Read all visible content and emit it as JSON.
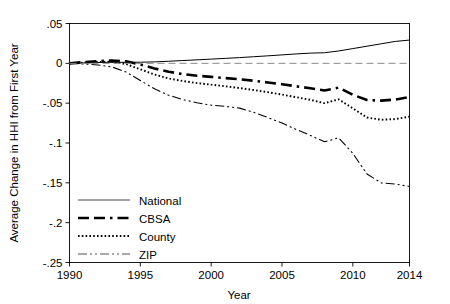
{
  "chart_data": {
    "type": "line",
    "title": "",
    "xlabel": "Year",
    "ylabel": "Average Change in HHI from First Year",
    "xlim": [
      1990,
      2014
    ],
    "ylim": [
      -0.25,
      0.05
    ],
    "xticks": [
      1990,
      1995,
      2000,
      2005,
      2010,
      2014
    ],
    "xtick_labels": [
      "1990",
      "1995",
      "2000",
      "2005",
      "2010",
      "2014"
    ],
    "yticks": [
      0.05,
      0,
      -0.05,
      -0.1,
      -0.15,
      -0.2,
      -0.25
    ],
    "ytick_labels": [
      ".05",
      "0",
      "-.05",
      "-.1",
      "-.15",
      "-.2",
      "-.25"
    ],
    "grid": false,
    "legend_position": "lower-left",
    "x": [
      1990,
      1991,
      1992,
      1993,
      1994,
      1995,
      1996,
      1997,
      1998,
      1999,
      2000,
      2001,
      2002,
      2003,
      2004,
      2005,
      2006,
      2007,
      2008,
      2009,
      2010,
      2011,
      2012,
      2013,
      2014
    ],
    "series": [
      {
        "name": "National",
        "style": "solid",
        "color": "#444444",
        "values": [
          0,
          0.0005,
          0.001,
          0.0013,
          0.0012,
          0.0014,
          0.0018,
          0.0026,
          0.0035,
          0.0044,
          0.0053,
          0.0062,
          0.0072,
          0.0083,
          0.0094,
          0.0106,
          0.0118,
          0.0128,
          0.0133,
          0.0155,
          0.0185,
          0.0215,
          0.0245,
          0.0275,
          0.0292
        ]
      },
      {
        "name": "CBSA",
        "style": "dashed",
        "color": "#000000",
        "values": [
          0,
          0.0015,
          0.0028,
          0.0035,
          0.0025,
          -0.0015,
          -0.0065,
          -0.0105,
          -0.0135,
          -0.0155,
          -0.017,
          -0.0185,
          -0.02,
          -0.0218,
          -0.024,
          -0.0262,
          -0.0288,
          -0.0312,
          -0.034,
          -0.0305,
          -0.0395,
          -0.046,
          -0.0468,
          -0.0455,
          -0.0423
        ]
      },
      {
        "name": "County",
        "style": "dotted",
        "color": "#000000",
        "values": [
          0,
          0.001,
          0.0018,
          0.002,
          -0.001,
          -0.0075,
          -0.014,
          -0.019,
          -0.0222,
          -0.0248,
          -0.0268,
          -0.0288,
          -0.031,
          -0.0335,
          -0.0362,
          -0.0392,
          -0.0425,
          -0.0458,
          -0.05,
          -0.0452,
          -0.0565,
          -0.068,
          -0.0708,
          -0.07,
          -0.067
        ]
      },
      {
        "name": "ZIP",
        "style": "dashdot",
        "color": "#555555",
        "values": [
          0,
          -0.0008,
          -0.002,
          -0.0045,
          -0.011,
          -0.0215,
          -0.032,
          -0.04,
          -0.0455,
          -0.0495,
          -0.0525,
          -0.054,
          -0.0562,
          -0.0615,
          -0.068,
          -0.075,
          -0.083,
          -0.0905,
          -0.0985,
          -0.0935,
          -0.113,
          -0.139,
          -0.15,
          -0.1515,
          -0.1545
        ]
      }
    ]
  },
  "legend": {
    "items": [
      {
        "label": "National",
        "style": "solid"
      },
      {
        "label": "CBSA",
        "style": "dashed"
      },
      {
        "label": "County",
        "style": "dotted"
      },
      {
        "label": "ZIP",
        "style": "dashdot"
      }
    ]
  }
}
